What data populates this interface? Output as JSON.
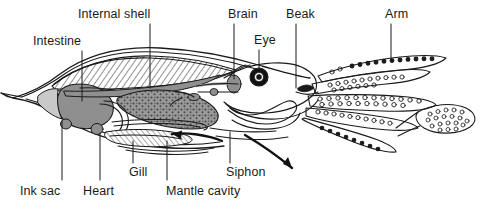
{
  "diagram": {
    "type": "labeled-anatomical-line-drawing",
    "background_color": "#ffffff",
    "line_color": "#1a1a1a",
    "organ_fill_gray": "#8f8f8f",
    "organ_fill_light": "#c9c9c9",
    "hatch_fill": "#d8d8d8",
    "label_color": "#1a1a1a"
  },
  "labels": [
    {
      "id": "internal-shell",
      "text": "Internal shell",
      "x": 78,
      "y": 8,
      "leader": {
        "x1": 150,
        "y1": 24,
        "x2": 150,
        "y2": 88
      }
    },
    {
      "id": "intestine",
      "text": "Intestine",
      "x": 33,
      "y": 35,
      "leader": {
        "x1": 82,
        "y1": 51,
        "x2": 82,
        "y2": 101
      }
    },
    {
      "id": "brain",
      "text": "Brain",
      "x": 228,
      "y": 8,
      "leader": {
        "x1": 234,
        "y1": 24,
        "x2": 234,
        "y2": 79
      }
    },
    {
      "id": "eye",
      "text": "Eye",
      "x": 254,
      "y": 34,
      "leader": {
        "x1": 259,
        "y1": 50,
        "x2": 259,
        "y2": 70
      }
    },
    {
      "id": "beak",
      "text": "Beak",
      "x": 286,
      "y": 8,
      "leader": {
        "x1": 296,
        "y1": 24,
        "x2": 296,
        "y2": 90
      }
    },
    {
      "id": "arm",
      "text": "Arm",
      "x": 385,
      "y": 8,
      "leader": {
        "x1": 391,
        "y1": 24,
        "x2": 391,
        "y2": 59
      }
    },
    {
      "id": "ink-sac",
      "text": "Ink sac",
      "x": 20,
      "y": 185,
      "leader": {
        "x1": 62,
        "y1": 121,
        "x2": 62,
        "y2": 180
      }
    },
    {
      "id": "heart",
      "text": "Heart",
      "x": 83,
      "y": 185,
      "leader": {
        "x1": 100,
        "y1": 133,
        "x2": 100,
        "y2": 180
      }
    },
    {
      "id": "gill",
      "text": "Gill",
      "x": 129,
      "y": 168,
      "leader": {
        "x1": 133,
        "y1": 141,
        "x2": 133,
        "y2": 163
      }
    },
    {
      "id": "mantle-cavity",
      "text": "Mantle cavity",
      "x": 166,
      "y": 185,
      "leader": {
        "x1": 167,
        "y1": 141,
        "x2": 167,
        "y2": 180
      }
    },
    {
      "id": "siphon",
      "text": "Siphon",
      "x": 226,
      "y": 168,
      "leader": {
        "x1": 230,
        "y1": 132,
        "x2": 230,
        "y2": 163
      }
    }
  ],
  "flow_arrows": [
    {
      "id": "water-in-arrow",
      "description": "water drawn into mantle cavity, pointing left"
    },
    {
      "id": "water-out-arrow",
      "description": "water expelled through siphon, pointing lower-right"
    }
  ],
  "structures": [
    {
      "id": "mantle",
      "description": "outer mantle body wall tapering to pointed tail at left"
    },
    {
      "id": "internal-shell",
      "description": "hatched pen/gladius crescent inside dorsal mantle"
    },
    {
      "id": "digestive-gland",
      "description": "stippled elongated organ in mid mantle"
    },
    {
      "id": "intestine-mass",
      "description": "large gray visceral mass toward the tail"
    },
    {
      "id": "ink-sac",
      "description": "small gray sac near heart"
    },
    {
      "id": "heart",
      "description": "small gray nodule ventral to visceral mass"
    },
    {
      "id": "gill",
      "description": "hatched feather-shaped gill in mantle cavity"
    },
    {
      "id": "siphon",
      "description": "funnel opening below head"
    },
    {
      "id": "brain",
      "description": "gray nerve mass behind eye"
    },
    {
      "id": "eye",
      "description": "black ring eye with pale iris and dark pupil"
    },
    {
      "id": "beak",
      "description": "chitinous jaws at mouth between arm bases"
    },
    {
      "id": "arms",
      "description": "eight arms bearing paired rows of suckers"
    },
    {
      "id": "tentacle-club",
      "description": "expanded sucker-bearing club of long tentacle at far right"
    }
  ]
}
